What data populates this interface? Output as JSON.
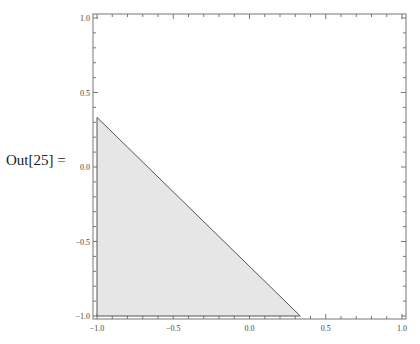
{
  "cell": {
    "output_label": "Out[25] ="
  },
  "chart_data": {
    "type": "area",
    "title": "",
    "xlabel": "",
    "ylabel": "",
    "xlim": [
      -1.0,
      1.0
    ],
    "ylim": [
      -1.0,
      1.0
    ],
    "grid": false,
    "frame": true,
    "x_ticks": [
      "-1.0",
      "-0.5",
      "0.0",
      "0.5",
      "1.0"
    ],
    "y_ticks": [
      "-1.0",
      "-0.5",
      "0.0",
      "0.5",
      "1.0"
    ],
    "series": [
      {
        "name": "region",
        "shape": "polygon",
        "points": [
          [
            -1.0,
            -1.0
          ],
          [
            -1.0,
            0.333
          ],
          [
            0.333,
            -1.0
          ]
        ],
        "fill": "#e6e6e6",
        "stroke": "#555555"
      }
    ]
  }
}
